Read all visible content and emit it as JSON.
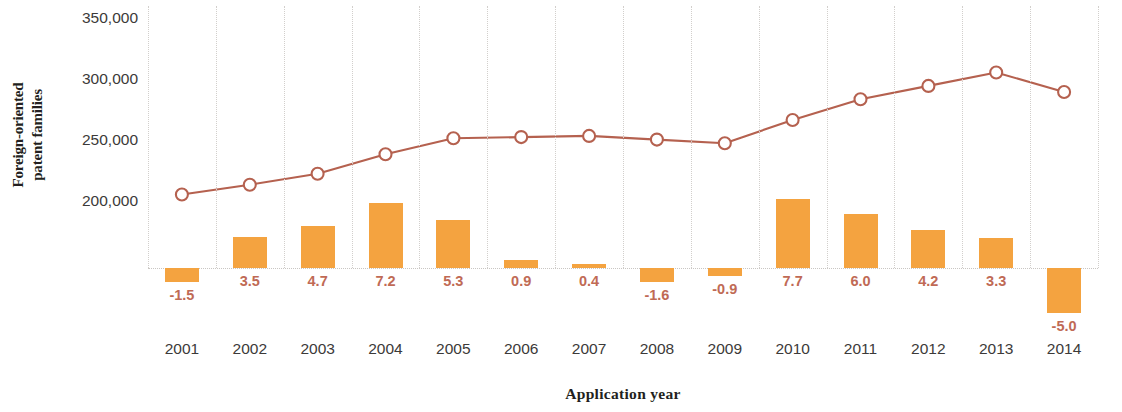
{
  "chart_data": {
    "type": "line",
    "title": "",
    "xlabel": "Application year",
    "ylabel": "Foreign-oriented\npatent families",
    "ylabel_line1": "Foreign-oriented",
    "ylabel_line2": "patent families",
    "categories": [
      "2001",
      "2002",
      "2003",
      "2004",
      "2005",
      "2006",
      "2007",
      "2008",
      "2009",
      "2010",
      "2011",
      "2012",
      "2013",
      "2014"
    ],
    "ylim": [
      null,
      350000
    ],
    "yticks": [
      200000,
      250000,
      300000,
      350000
    ],
    "ytick_labels": [
      "200,000",
      "250,000",
      "300,000",
      "350,000"
    ],
    "grid": "dotted vertical gridlines and dotted zero baseline",
    "legend": "none",
    "series": [
      {
        "name": "Foreign-oriented patent families",
        "type": "line",
        "marker": "open-circle",
        "color": "#b5614f",
        "values": [
          207000,
          215000,
          224000,
          240000,
          253000,
          254000,
          255000,
          252000,
          249000,
          268000,
          285000,
          296000,
          307000,
          291000
        ]
      },
      {
        "name": "Growth rate (%)",
        "type": "bar",
        "color": "#f4a340",
        "unit": "%",
        "values": [
          -1.5,
          3.5,
          4.7,
          7.2,
          5.3,
          0.9,
          0.4,
          -1.6,
          -0.9,
          7.7,
          6.0,
          4.2,
          3.3,
          -5.0
        ],
        "labels": [
          "-1.5",
          "3.5",
          "4.7",
          "7.2",
          "5.3",
          "0.9",
          "0.4",
          "-1.6",
          "-0.9",
          "7.7",
          "6.0",
          "4.2",
          "3.3",
          "-5.0"
        ]
      }
    ]
  },
  "colors": {
    "bar": "#f4a340",
    "line": "#b5614f",
    "bar_label_text": "#c06a55",
    "axis_text": "#3c3a39",
    "grid": "#d2cfcc",
    "background": "#ffffff"
  }
}
